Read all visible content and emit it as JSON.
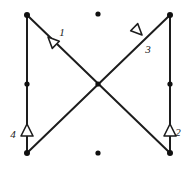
{
  "diagram": {
    "canvas": {
      "width": 192,
      "height": 171,
      "background": "#ffffff"
    },
    "stroke_color": "#1d1d1d",
    "node_color": "#101010",
    "members": [
      {
        "name": "left-vertical-member",
        "x1": 27,
        "y1": 15,
        "x2": 27,
        "y2": 153
      },
      {
        "name": "right-vertical-member",
        "x1": 170,
        "y1": 15,
        "x2": 170,
        "y2": 153
      },
      {
        "name": "diagonal-top-left-to-bottom-right",
        "x1": 27,
        "y1": 15,
        "x2": 170,
        "y2": 153
      },
      {
        "name": "diagonal-top-right-to-bottom-left",
        "x1": 170,
        "y1": 15,
        "x2": 27,
        "y2": 153
      }
    ],
    "nodes": [
      {
        "name": "node-top-left",
        "cx": 27,
        "cy": 15,
        "r": 3.0
      },
      {
        "name": "node-top-right",
        "cx": 170,
        "cy": 15,
        "r": 3.0
      },
      {
        "name": "node-bottom-left",
        "cx": 27,
        "cy": 153,
        "r": 3.0
      },
      {
        "name": "node-bottom-right",
        "cx": 170,
        "cy": 153,
        "r": 3.0
      },
      {
        "name": "node-left-midspan",
        "cx": 27,
        "cy": 84,
        "r": 2.6
      },
      {
        "name": "node-right-midspan",
        "cx": 170,
        "cy": 84,
        "r": 2.6
      },
      {
        "name": "node-center-crossing",
        "cx": 98,
        "cy": 84,
        "r": 2.6
      },
      {
        "name": "node-top-center-free",
        "cx": 98,
        "cy": 14,
        "r": 2.6
      },
      {
        "name": "node-bottom-center-free",
        "cx": 98,
        "cy": 153,
        "r": 2.6
      }
    ],
    "markers": [
      {
        "name": "force-marker-1",
        "label": "1",
        "tip_x": 48,
        "tip_y": 37,
        "rotation": 45,
        "label_x": 62,
        "label_y": 33
      },
      {
        "name": "force-marker-3",
        "label": "3",
        "tip_x": 142,
        "tip_y": 35,
        "rotation": 225,
        "label_x": 148,
        "label_y": 50
      },
      {
        "name": "force-marker-4",
        "label": "4",
        "tip_x": 27,
        "tip_y": 124,
        "rotation": 0,
        "label_x": 13,
        "label_y": 135
      },
      {
        "name": "force-marker-2",
        "label": "2",
        "tip_x": 170,
        "tip_y": 124,
        "rotation": 0,
        "label_x": 178,
        "label_y": 133
      }
    ]
  }
}
